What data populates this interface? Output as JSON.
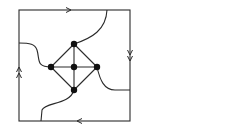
{
  "diagram": {
    "colors": {
      "stroke": "#2a2a2a",
      "vertex": "#111111",
      "background": "#ffffff"
    },
    "square": {
      "x": 19,
      "y": 10,
      "width": 111,
      "height": 111
    },
    "edge_arrows": [
      {
        "side": "top",
        "direction": "right",
        "count": 1
      },
      {
        "side": "right",
        "direction": "down",
        "count": 2
      },
      {
        "side": "bottom",
        "direction": "left",
        "count": 1
      },
      {
        "side": "left",
        "direction": "up",
        "count": 2
      }
    ],
    "vertices": [
      {
        "id": "top",
        "x": 74,
        "y": 44
      },
      {
        "id": "left",
        "x": 51,
        "y": 67
      },
      {
        "id": "center",
        "x": 74,
        "y": 67
      },
      {
        "id": "right",
        "x": 97,
        "y": 67
      },
      {
        "id": "bottom",
        "x": 74,
        "y": 90
      }
    ],
    "edges": [
      [
        "top",
        "left"
      ],
      [
        "top",
        "right"
      ],
      [
        "bottom",
        "left"
      ],
      [
        "bottom",
        "right"
      ],
      [
        "left",
        "center"
      ],
      [
        "center",
        "right"
      ],
      [
        "top",
        "center"
      ],
      [
        "center",
        "bottom"
      ]
    ],
    "boundary_curves": [
      {
        "from": "top",
        "to_side": "top",
        "end": [
          107,
          10
        ]
      },
      {
        "from": "left",
        "to_side": "left",
        "end": [
          19,
          43
        ]
      },
      {
        "from": "right",
        "to_side": "right",
        "end": [
          130,
          90
        ]
      },
      {
        "from": "bottom",
        "to_side": "bottom",
        "end": [
          41,
          121
        ]
      }
    ]
  }
}
